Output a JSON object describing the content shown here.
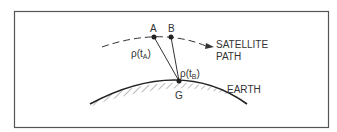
{
  "figure": {
    "frame_color": "#555555",
    "ink_color": "#333333",
    "points": {
      "A": {
        "label": "A"
      },
      "B": {
        "label": "B"
      },
      "G": {
        "label": "G"
      }
    },
    "ranges": {
      "rho_A": {
        "symbol": "ρ(t",
        "subscript": "A",
        "close": ")"
      },
      "rho_B": {
        "symbol": "ρ(t",
        "subscript": "B",
        "close": ")"
      }
    },
    "labels": {
      "satellite_path_line1": "SATELLITE",
      "satellite_path_line2": "PATH",
      "earth": "EARTH"
    }
  }
}
